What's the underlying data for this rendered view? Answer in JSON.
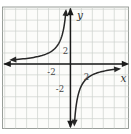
{
  "figure": {
    "background_color": "#ffffff",
    "plot_background_color": "#fcfcfa",
    "frame_color": "#8f948f",
    "grid_color": "#cdd1cd",
    "axis_color": "#1a1a1a",
    "curve_color": "#272727",
    "tick_label_color": "#454545",
    "axis_label_color": "#303030"
  },
  "chart_data": {
    "type": "line",
    "title": "",
    "xlabel": "x",
    "ylabel": "y",
    "function": "y = -2/x",
    "k": -2,
    "grid": true,
    "grid_unit": 1,
    "xlim": [
      -6.2,
      5.3
    ],
    "ylim": [
      -5.9,
      5.2
    ],
    "x_ticks": [
      {
        "value": -2,
        "label": "-2"
      },
      {
        "value": 2,
        "label": "2"
      }
    ],
    "y_ticks": [
      {
        "value": 2,
        "label": "2"
      },
      {
        "value": -2,
        "label": "-2"
      }
    ],
    "series": [
      {
        "name": "branch-quadrant-II",
        "points": [
          [
            -5.35,
            0.37
          ],
          [
            -4,
            0.5
          ],
          [
            -2,
            1
          ],
          [
            -1,
            2
          ],
          [
            -0.5,
            4
          ],
          [
            -0.42,
            4.8
          ]
        ]
      },
      {
        "name": "branch-quadrant-IV",
        "points": [
          [
            0.36,
            -5.5
          ],
          [
            0.5,
            -4
          ],
          [
            1,
            -2
          ],
          [
            2,
            -1
          ],
          [
            4,
            -0.5
          ],
          [
            4.4,
            -0.45
          ]
        ]
      }
    ]
  }
}
